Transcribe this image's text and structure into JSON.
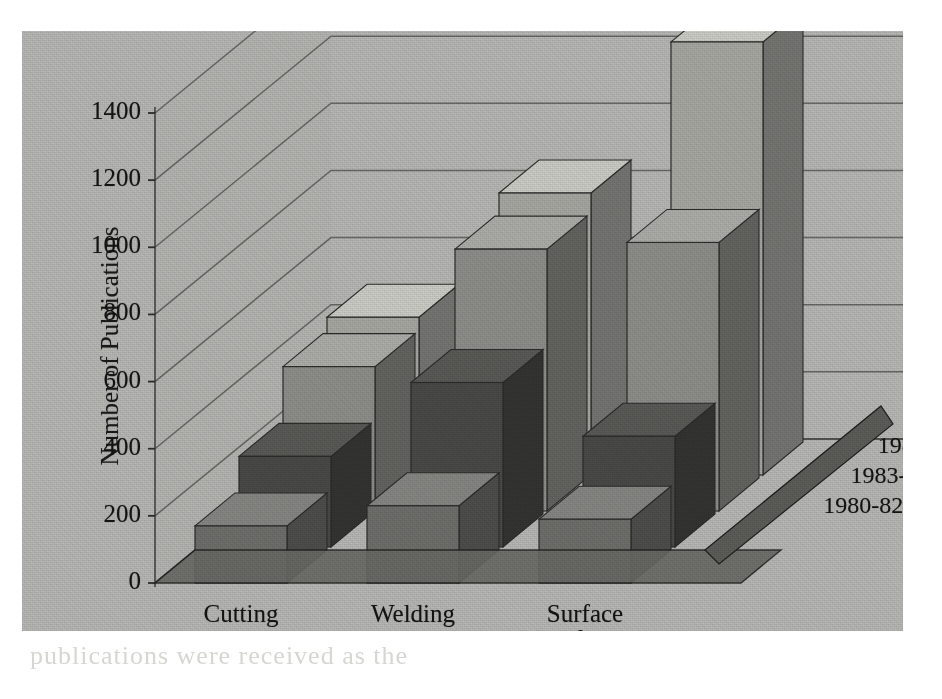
{
  "figure": {
    "background_color": "#b9b9b6",
    "page_color": "#ffffff",
    "ghost_text": "publications were received as the"
  },
  "chart_data": {
    "type": "bar",
    "subtype": "3d-grouped-bar",
    "title": "",
    "xlabel": "",
    "ylabel": "Number of Publications",
    "zlabel": "",
    "categories": [
      "Cutting",
      "Welding",
      "Surface Modification"
    ],
    "category_lines": [
      [
        "Cutting"
      ],
      [
        "Welding"
      ],
      [
        "Surface",
        "Modification"
      ]
    ],
    "series": [
      {
        "name": "1980-82",
        "values": [
          170,
          230,
          190
        ]
      },
      {
        "name": "1983-85",
        "values": [
          270,
          490,
          330
        ]
      },
      {
        "name": "1986-88",
        "values": [
          430,
          780,
          800
        ]
      },
      {
        "name": "1989-91",
        "values": [
          470,
          840,
          1290
        ]
      }
    ],
    "ylim": [
      0,
      1400
    ],
    "yticks": [
      0,
      200,
      400,
      600,
      800,
      1000,
      1200,
      1400
    ],
    "ytick_labels": [
      "0",
      "200",
      "400",
      "600",
      "800",
      "1000",
      "1200",
      "1400"
    ],
    "grid": true,
    "grid_axis": "y",
    "legend": "depth-axis-labels",
    "legend_position": "right",
    "series_colors": [
      "#6f6f6c",
      "#4a4a47",
      "#8f8f8b",
      "#a9a9a4"
    ],
    "units": "publications"
  },
  "axis": {
    "y_title": "Number of Publications",
    "ticks": [
      {
        "label": "1400"
      },
      {
        "label": "1200"
      },
      {
        "label": "1000"
      },
      {
        "label": "800"
      },
      {
        "label": "600"
      },
      {
        "label": "400"
      },
      {
        "label": "200"
      },
      {
        "label": "0"
      }
    ]
  },
  "x_categories": [
    {
      "line1": "Cutting",
      "line2": ""
    },
    {
      "line1": "Welding",
      "line2": ""
    },
    {
      "line1": "Surface",
      "line2": "Modification"
    }
  ],
  "depth_labels": [
    {
      "label": "1989-91"
    },
    {
      "label": "1986-88"
    },
    {
      "label": "1983-85"
    },
    {
      "label": "1980-82"
    }
  ]
}
